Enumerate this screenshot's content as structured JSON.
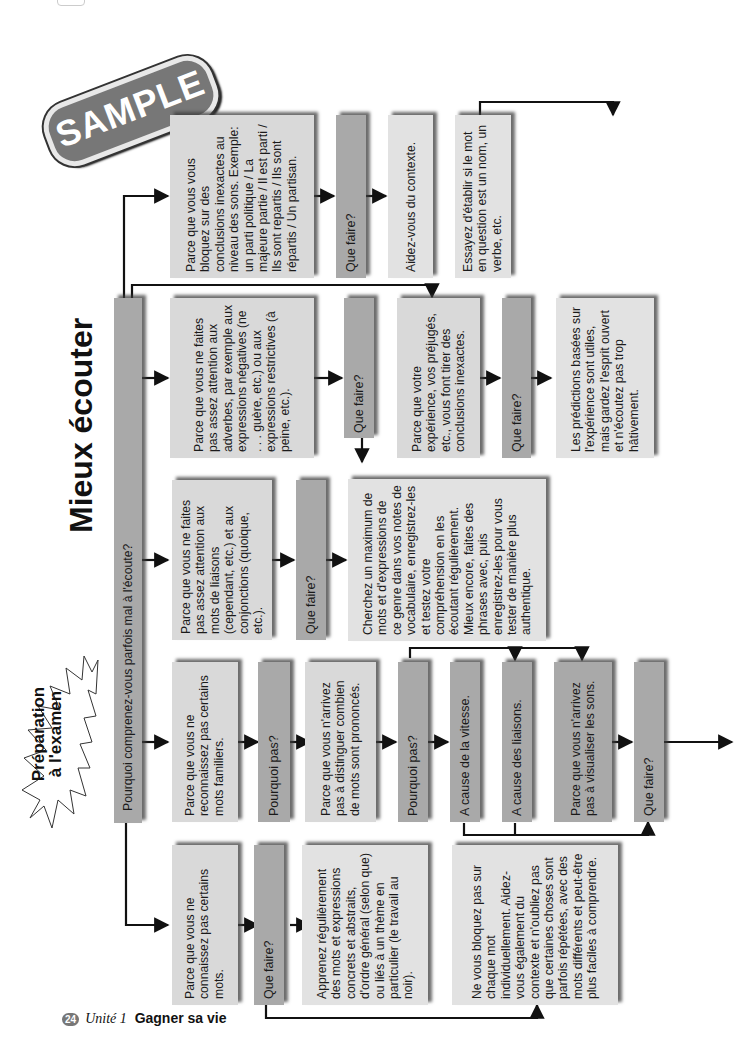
{
  "page": {
    "badge": "SAMPLE",
    "title": "Mieux écouter",
    "burst_label": [
      "Préparation",
      "à l'examen"
    ],
    "footer": {
      "page_number": "24",
      "unit": "Unité 1",
      "chapter": "Gagner sa vie"
    }
  },
  "flowchart": {
    "root": "Pourquoi comprenez-vous parfois mal à l'écoute?",
    "branch1": {
      "cause": "Parce que vous ne connaissez pas certains mots.",
      "question": "Que faire?",
      "answer1": "Apprenez régulièrement des mots et expressions concrets et abstraits, d'ordre général (selon que) ou liés à un thème en particulier (le travail au noir).",
      "answer2": "Ne vous bloquez pas sur chaque mot individuellement. Aidez-vous également du contexte et n'oubliez pas que certaines choses sont parfois répétées, avec des mots différents et peut-être plus faciles à comprendre."
    },
    "branch2": {
      "cause": "Parce que vous ne reconnaissez pas certains mots familiers.",
      "question1": "Pourquoi pas?",
      "cause2": "Parce que vous n'arrivez pas à distinguer combien de mots sont prononcés.",
      "question2": "Pourquoi pas?",
      "reason_speed": "A cause de la vitesse.",
      "reason_liaisons": "A cause des liaisons.",
      "reason_visualize": "Parce que vous n'arrivez pas à visualiser les sons.",
      "question3": "Que faire?"
    },
    "branch3": {
      "cause": "Parce que vous ne faites pas assez attention aux mots de liaisons (cependant, etc.) et aux conjonctions (quoique, etc.).",
      "question": "Que faire?",
      "answer": "Cherchez un maximum de mots et d'expressions de ce genre dans vos notes de vocabulaire, enregistrez-les et testez votre compréhension en les écoutant régulièrement. Mieux encore, faites des phrases avec, puis enregistrez-les pour vous tester de manière plus authentique."
    },
    "branch4": {
      "cause": "Parce que vous ne faites pas assez attention aux adverbes, par exemple aux expressions négatives (ne . . . guère, etc.) ou aux expressions restrictives (à peine, etc.).",
      "question": "Que faire?"
    },
    "branch5": {
      "cause": "Parce que votre expérience, vos préjugés, etc., vous font tirer des conclusions inexactes.",
      "question": "Que faire?",
      "answer": "Les prédictions basées sur l'expérience sont utiles, mais gardez l'esprit ouvert et n'écoutez pas trop hâtivement."
    },
    "branch6": {
      "cause": "Parce que vous vous bloquez sur des conclusions inexactes au niveau des sons. Exemple: un parti politique / La majeure partie / Il est parti / Ils sont repartis / Ils sont répartis / Un partisan.",
      "question": "Que faire?",
      "answer1": "Aidez-vous du contexte.",
      "answer2": "Essayez d'établir si le mot en question est un nom, un verbe, etc."
    }
  }
}
